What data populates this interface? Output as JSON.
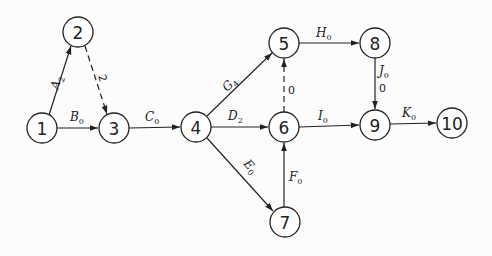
{
  "diagram": {
    "type": "activity-on-arrow network",
    "nodes": [
      {
        "id": "1",
        "x": 42,
        "y": 128
      },
      {
        "id": "2",
        "x": 78,
        "y": 32
      },
      {
        "id": "3",
        "x": 114,
        "y": 128
      },
      {
        "id": "4",
        "x": 196,
        "y": 127
      },
      {
        "id": "5",
        "x": 284,
        "y": 43
      },
      {
        "id": "6",
        "x": 284,
        "y": 127
      },
      {
        "id": "7",
        "x": 285,
        "y": 222
      },
      {
        "id": "8",
        "x": 375,
        "y": 43
      },
      {
        "id": "9",
        "x": 375,
        "y": 125
      },
      {
        "id": "10",
        "x": 452,
        "y": 123
      }
    ],
    "edges": [
      {
        "from": "1",
        "to": "2",
        "activity": "A",
        "sub": "2",
        "dummy": false
      },
      {
        "from": "2",
        "to": "3",
        "activity": "",
        "sub": "",
        "value": "2",
        "dummy": true
      },
      {
        "from": "1",
        "to": "3",
        "activity": "B",
        "sub": "0",
        "dummy": false
      },
      {
        "from": "3",
        "to": "4",
        "activity": "C",
        "sub": "0",
        "dummy": false
      },
      {
        "from": "4",
        "to": "5",
        "activity": "G",
        "sub": "4",
        "dummy": false
      },
      {
        "from": "4",
        "to": "6",
        "activity": "D",
        "sub": "2",
        "dummy": false
      },
      {
        "from": "4",
        "to": "7",
        "activity": "E",
        "sub": "0",
        "dummy": false
      },
      {
        "from": "6",
        "to": "5",
        "activity": "",
        "sub": "",
        "value": "0",
        "dummy": true
      },
      {
        "from": "7",
        "to": "6",
        "activity": "F",
        "sub": "0",
        "dummy": false
      },
      {
        "from": "5",
        "to": "8",
        "activity": "H",
        "sub": "0",
        "dummy": false
      },
      {
        "from": "6",
        "to": "9",
        "activity": "I",
        "sub": "0",
        "dummy": false
      },
      {
        "from": "8",
        "to": "9",
        "activity": "J",
        "sub": "0",
        "value": "0",
        "dummy": false
      },
      {
        "from": "9",
        "to": "10",
        "activity": "K",
        "sub": "0",
        "dummy": false
      }
    ]
  },
  "labels": {
    "A": "A",
    "A_sub": "2",
    "d23": "2",
    "B": "B",
    "B_sub": "0",
    "C": "C",
    "C_sub": "0",
    "G": "G",
    "G_sub": "4",
    "D": "D",
    "D_sub": "2",
    "E": "E",
    "E_sub": "0",
    "d65": "0",
    "F": "F",
    "F_sub": "0",
    "H": "H",
    "H_sub": "0",
    "I": "I",
    "I_sub": "0",
    "J": "J",
    "J_sub": "0",
    "J_val": "0",
    "K": "K",
    "K_sub": "0"
  },
  "node_labels": [
    "1",
    "2",
    "3",
    "4",
    "5",
    "6",
    "7",
    "8",
    "9",
    "10"
  ]
}
